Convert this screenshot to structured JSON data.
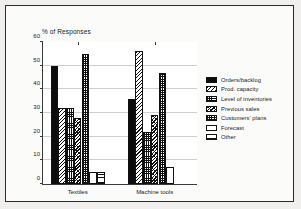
{
  "chart_data": {
    "type": "bar",
    "title": "% of Responses",
    "xlabel": "",
    "ylabel": "",
    "ylim": [
      0,
      60
    ],
    "yticks": [
      "0",
      "10",
      "20",
      "30",
      "40",
      "50",
      "60"
    ],
    "grid": true,
    "legend_position": "right",
    "categories": [
      "Textiles",
      "Machine tools"
    ],
    "series": [
      {
        "name": "Orders/backlog",
        "pattern": "solid-black",
        "values": [
          50,
          36
        ]
      },
      {
        "name": "Prod. capacity",
        "pattern": "diagonal-hatch",
        "values": [
          32,
          56
        ]
      },
      {
        "name": "Level of inventories",
        "pattern": "fine-grid",
        "values": [
          32,
          22
        ]
      },
      {
        "name": "Previous sales",
        "pattern": "dense-diagonal",
        "values": [
          28,
          29
        ]
      },
      {
        "name": "Customers' plans",
        "pattern": "checkerboard",
        "values": [
          55,
          47
        ]
      },
      {
        "name": "Forecast",
        "pattern": "white",
        "values": [
          5,
          7
        ]
      },
      {
        "name": "Other",
        "pattern": "horizontal-lines",
        "values": [
          5,
          0
        ]
      }
    ]
  },
  "colors": {
    "ink": "#111111",
    "background": "#ffffff",
    "frame": "#2b2b2b",
    "grid": "#cfcfcf"
  }
}
